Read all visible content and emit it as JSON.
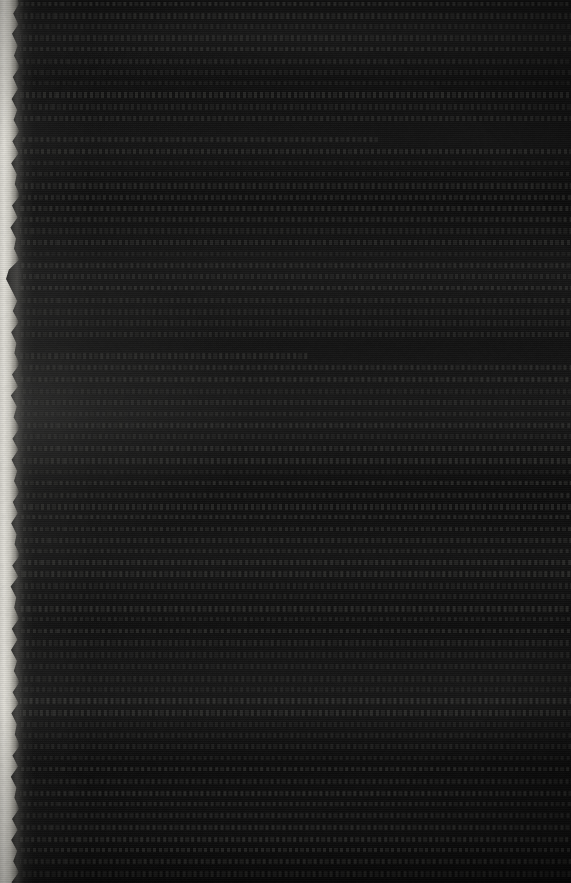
{
  "image": {
    "kind": "photograph",
    "subject": "printed page, severely underexposed",
    "width_px": 571,
    "height_px": 883,
    "legibility_note": "No text is legible at any magnification. No words, heading, page number or caption can be read, so none are recorded.",
    "text_content_readable": false
  },
  "observed": {
    "dominant_appearance": "near-black field with faint horizontal banding",
    "background_color": "#0e0e0e",
    "darkest_color": "#070707",
    "paper_ink_band_color": "#383836",
    "lit_edge_color": "#e6e4dd",
    "lit_edge_shadow_color": "#8f8d86"
  },
  "lit_edge": {
    "name": "illuminated paper edge",
    "position": "left",
    "x_start_px": 0,
    "x_end_px": 20,
    "boundary": "ragged / irregular, resembling a rough or deckled paper edge",
    "description": "The only brightly exposed region in the frame; the page edge catching the available light."
  },
  "text_block": {
    "columns": 1,
    "layout": "single column spanning the full width of the frame",
    "left_edge_px": 20,
    "right_edge_px": 571,
    "line_spacing_px": 11.5,
    "line_count_estimate": 76,
    "cropped_edges": [
      "top",
      "right",
      "bottom"
    ],
    "paragraph_break_positions_px": [
      130,
      350
    ],
    "description": "Regular horizontal banding at roughly 11 to 12 pixel intervals, consistent with printed body text lines."
  },
  "capture_artifacts": {
    "underexposure": "extreme",
    "visible_effects": [
      "horizontal scan banding",
      "broad exposure bands",
      "sensor noise",
      "vignetting"
    ]
  }
}
